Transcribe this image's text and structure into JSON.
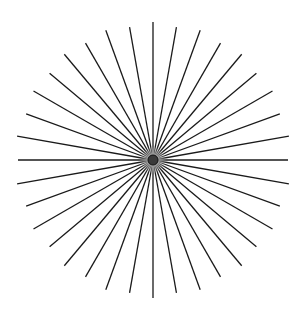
{
  "figure": {
    "type": "starburst",
    "center": [
      153,
      160
    ],
    "radius": 138,
    "line_count": 36,
    "angle_step_deg": 10,
    "line_color": "#1a1a1a",
    "line_width": 1.3,
    "center_dot": {
      "radius": 5,
      "fill": "#3a3a3a",
      "stroke": "#111111"
    },
    "background": "#ffffff"
  }
}
